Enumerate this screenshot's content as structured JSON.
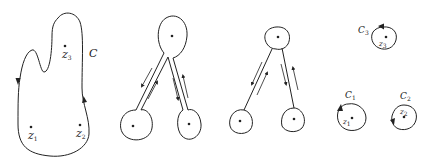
{
  "figure": {
    "stroke_color": "#222222",
    "background": "#ffffff"
  },
  "panels": [
    {
      "id": "panel-1",
      "contour_label": "C",
      "points": [
        {
          "name": "z",
          "sub": "3"
        },
        {
          "name": "z",
          "sub": "1"
        },
        {
          "name": "z",
          "sub": "2"
        }
      ]
    },
    {
      "id": "panel-2",
      "description": "Contour pinched into three lobes connected by paired cut lines with opposite arrows"
    },
    {
      "id": "panel-3",
      "description": "Three small circles joined by thin double-line cuts with opposite arrows"
    },
    {
      "id": "panel-4",
      "circles": [
        {
          "label": "C",
          "label_sub": "3",
          "point": "z",
          "point_sub": "3"
        },
        {
          "label": "C",
          "label_sub": "1",
          "point": "z",
          "point_sub": "1"
        },
        {
          "label": "C",
          "label_sub": "2",
          "point": "z",
          "point_sub": "2"
        }
      ]
    }
  ]
}
